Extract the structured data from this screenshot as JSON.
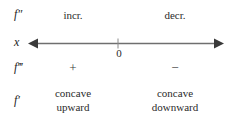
{
  "diagram": {
    "line_color": "#6f6f6f",
    "text_color": "#2b2b2b",
    "zero_label": "0",
    "axis_label": "x",
    "rows": [
      {
        "label": "f″",
        "left": "incr.",
        "right": "decr."
      },
      {
        "label": "f‴",
        "left": "+",
        "right": "−"
      },
      {
        "label": "f′",
        "left_line1": "concave",
        "left_line2": "upward",
        "right_line1": "concave",
        "right_line2": "downward"
      }
    ]
  }
}
